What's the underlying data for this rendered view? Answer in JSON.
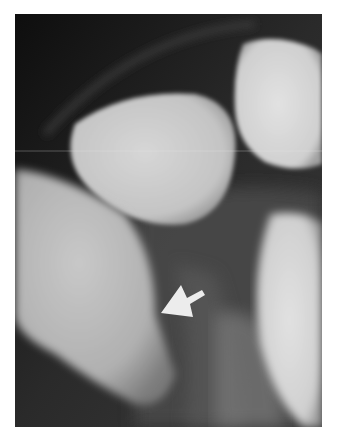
{
  "image": {
    "description": "Dental radiograph showing tooth crowns with a white arrow pointing to an interproximal area",
    "background": "#ffffff",
    "frame": {
      "x": 15,
      "y": 14,
      "width": 307,
      "height": 413
    },
    "colors": {
      "background_dark": "#1a1a1a",
      "tooth_bright": "#d8d8d8",
      "tooth_mid": "#a8a8a8",
      "soft_tissue": "#4a4a4a",
      "arrow": "#ececec"
    },
    "annotations": [
      {
        "type": "arrow",
        "direction": "pointing-down-left",
        "tip": [
          161,
          313
        ],
        "color": "#ececec"
      }
    ]
  }
}
